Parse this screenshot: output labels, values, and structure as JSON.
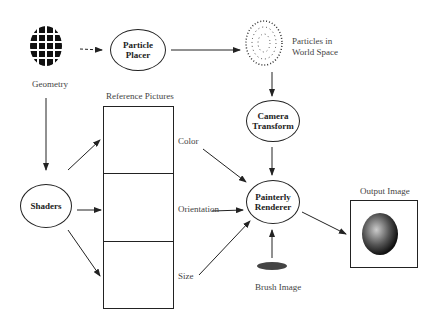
{
  "diagram": {
    "nodes": {
      "particle_placer": "Particle Placer",
      "camera_transform": "Camera Transform",
      "painterly_renderer": "Painterly Renderer",
      "shaders": "Shaders"
    },
    "labels": {
      "geometry": "Geometry",
      "particles_world_1": "Particles in",
      "particles_world_2": "World Space",
      "reference_pictures": "Reference Pictures",
      "color": "Color",
      "orientation": "Orientation",
      "size": "Size",
      "output_image": "Output Image",
      "brush_image": "Brush Image"
    },
    "node_lines": {
      "particle_placer": [
        "Particle",
        "Placer"
      ],
      "camera_transform": [
        "Camera",
        "Transform"
      ],
      "painterly_renderer": [
        "Painterly",
        "Renderer"
      ]
    }
  }
}
